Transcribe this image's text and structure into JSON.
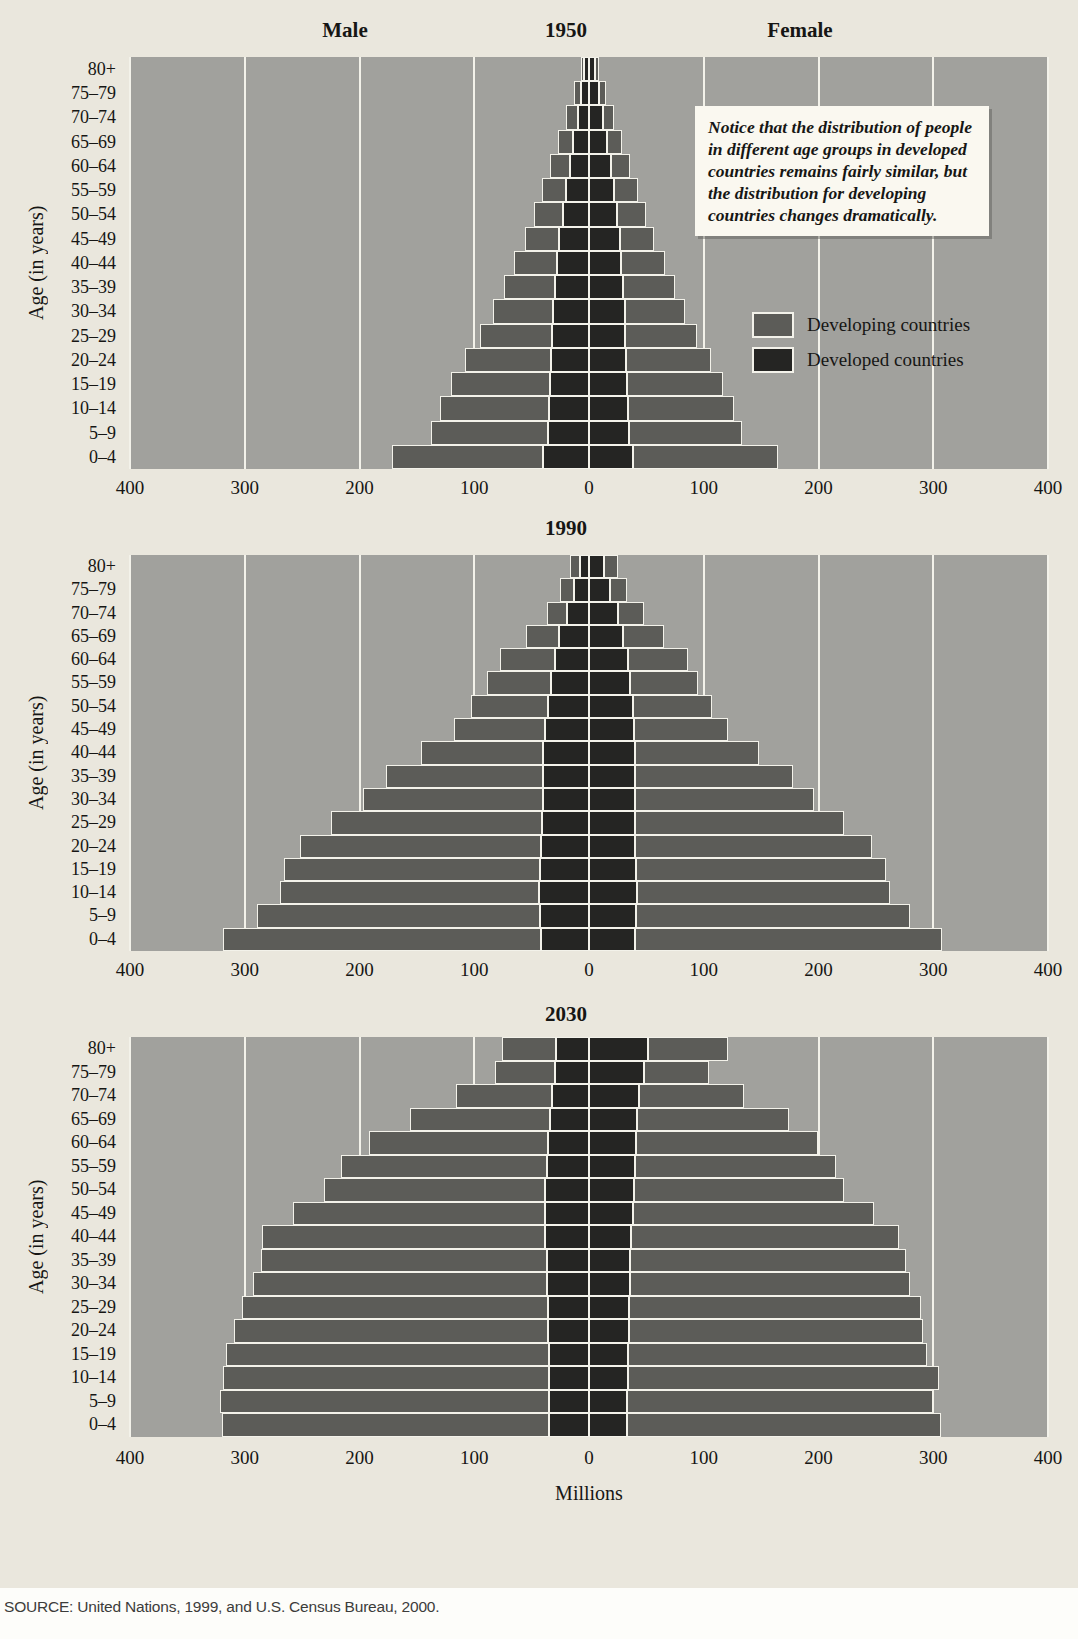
{
  "page": {
    "source_note": "SOURCE: United Nations, 1999, and U.S. Census Bureau, 2000."
  },
  "figure": {
    "y_axis_title": "Age (in years)",
    "x_axis_title": "Millions",
    "column_headers": {
      "male": "Male",
      "female": "Female"
    },
    "annotation": "Notice that the distribution of people in different age groups in developed countries remains fairly similar, but the distribution for developing countries changes dramatically.",
    "legend": [
      {
        "label": "Developing countries",
        "color": "#5c5c58"
      },
      {
        "label": "Developed countries",
        "color": "#252523"
      }
    ],
    "colors": {
      "page_background": "#eae7dd",
      "plot_background": "#a1a19d",
      "developing_bar": "#5c5c58",
      "developed_bar": "#252523",
      "grid_line": "#f3f2ea"
    }
  },
  "chart_data": [
    {
      "type": "bar",
      "variant": "population-pyramid",
      "title": "1950",
      "unit": "millions of people per 5-year age group, per sex",
      "axis_max": 400,
      "x_tick_labels": [
        "400",
        "300",
        "200",
        "100",
        "0",
        "100",
        "200",
        "300",
        "400"
      ],
      "age_groups": [
        "0–4",
        "5–9",
        "10–14",
        "15–19",
        "20–24",
        "25–29",
        "30–34",
        "35–39",
        "40–44",
        "45–49",
        "50–54",
        "55–59",
        "60–64",
        "65–69",
        "70–74",
        "75–79",
        "80+"
      ],
      "male": {
        "developing": [
          132,
          102,
          95,
          86,
          75,
          63,
          53,
          44,
          37,
          30,
          25,
          21,
          17,
          13,
          10,
          6,
          3
        ],
        "developed": [
          40,
          36,
          35,
          34,
          33,
          32,
          31,
          30,
          28,
          26,
          23,
          20,
          17,
          14,
          10,
          7,
          4
        ]
      },
      "female": {
        "developing": [
          127,
          98,
          92,
          84,
          74,
          63,
          53,
          45,
          38,
          30,
          26,
          21,
          17,
          13,
          10,
          6,
          4
        ],
        "developed": [
          38,
          35,
          34,
          33,
          32,
          31,
          31,
          30,
          28,
          27,
          24,
          22,
          19,
          16,
          12,
          9,
          5
        ]
      }
    },
    {
      "type": "bar",
      "variant": "population-pyramid",
      "title": "1990",
      "unit": "millions of people per 5-year age group, per sex",
      "axis_max": 400,
      "x_tick_labels": [
        "400",
        "300",
        "200",
        "100",
        "0",
        "100",
        "200",
        "300",
        "400"
      ],
      "age_groups": [
        "0–4",
        "5–9",
        "10–14",
        "15–19",
        "20–24",
        "25–29",
        "30–34",
        "35–39",
        "40–44",
        "45–49",
        "50–54",
        "55–59",
        "60–64",
        "65–69",
        "70–74",
        "75–79",
        "80+"
      ],
      "male": {
        "developing": [
          277,
          246,
          225,
          223,
          210,
          184,
          157,
          137,
          106,
          80,
          67,
          56,
          48,
          29,
          18,
          12,
          9
        ],
        "developed": [
          42,
          43,
          44,
          43,
          42,
          41,
          40,
          40,
          40,
          38,
          36,
          33,
          30,
          26,
          19,
          13,
          8
        ]
      },
      "female": {
        "developing": [
          268,
          239,
          220,
          218,
          207,
          182,
          156,
          138,
          108,
          82,
          69,
          59,
          52,
          35,
          23,
          15,
          12
        ],
        "developed": [
          40,
          41,
          42,
          41,
          40,
          40,
          40,
          40,
          40,
          39,
          38,
          36,
          34,
          30,
          25,
          18,
          13
        ]
      }
    },
    {
      "type": "bar",
      "variant": "population-pyramid",
      "title": "2030",
      "unit": "millions of people per 5-year age group, per sex",
      "axis_max": 400,
      "x_tick_labels": [
        "400",
        "300",
        "200",
        "100",
        "0",
        "100",
        "200",
        "300",
        "400"
      ],
      "age_groups": [
        "0–4",
        "5–9",
        "10–14",
        "15–19",
        "20–24",
        "25–29",
        "30–34",
        "35–39",
        "40–44",
        "45–49",
        "50–54",
        "55–59",
        "60–64",
        "65–69",
        "70–74",
        "75–79",
        "80+"
      ],
      "male": {
        "developing": [
          285,
          287,
          284,
          281,
          273,
          266,
          256,
          249,
          247,
          220,
          193,
          179,
          156,
          122,
          84,
          52,
          47
        ],
        "developed": [
          35,
          35,
          35,
          35,
          36,
          36,
          37,
          37,
          38,
          38,
          38,
          37,
          36,
          34,
          32,
          30,
          29
        ]
      },
      "female": {
        "developing": [
          274,
          267,
          271,
          261,
          256,
          254,
          244,
          240,
          233,
          210,
          183,
          175,
          159,
          132,
          91,
          57,
          70
        ],
        "developed": [
          33,
          33,
          34,
          34,
          35,
          35,
          36,
          36,
          37,
          38,
          39,
          40,
          41,
          42,
          44,
          48,
          51
        ]
      }
    }
  ]
}
